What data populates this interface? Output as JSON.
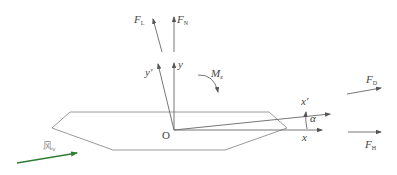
{
  "diagram": {
    "type": "force diagram on hull-shaped body with rotated coordinate axes",
    "origin_label": "O",
    "axes": {
      "x": "x",
      "y": "y",
      "x_prime": "x'",
      "y_prime": "y'"
    },
    "angle_label": "α",
    "moment": {
      "symbol": "M",
      "subscript": "z"
    },
    "forces": [
      {
        "id": "lift",
        "symbol": "F",
        "subscript": "L"
      },
      {
        "id": "normal",
        "symbol": "F",
        "subscript": "N"
      },
      {
        "id": "drag",
        "symbol": "F",
        "subscript": "D"
      },
      {
        "id": "horizontal",
        "symbol": "F",
        "subscript": "H"
      }
    ],
    "incoming_flow": {
      "label": "风",
      "subscript": "v",
      "color": "#2e7d32"
    },
    "colors": {
      "lines": "#777777",
      "hull": "#999999",
      "flow_arrow": "#2e7d32"
    }
  }
}
